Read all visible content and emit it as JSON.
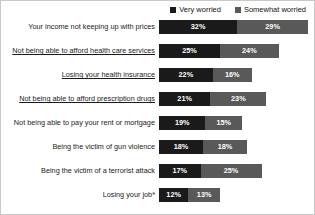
{
  "legend": {
    "position": "top-right",
    "items": [
      {
        "label": "Very worried",
        "color": "#1a1a1a",
        "key": "very"
      },
      {
        "label": "Somewhat worried",
        "color": "#595959",
        "key": "somewhat"
      }
    ]
  },
  "colors": {
    "very_worried": "#1a1a1a",
    "somewhat_worried": "#595959",
    "value_text": "#ffffff",
    "label_text": "#1a1a1a",
    "background": "#ffffff",
    "border": "#c9c9c9"
  },
  "chart_data": {
    "type": "bar",
    "orientation": "horizontal",
    "stacked": true,
    "title": "",
    "subtitle": "",
    "xlabel": "",
    "ylabel": "",
    "grid": false,
    "legend_position": "top-right",
    "xlim": [
      0,
      61
    ],
    "value_suffix": "%",
    "categories": [
      "Your income not keeping up with prices",
      "Not being able to afford health care services",
      "Losing your health insurance",
      "Not being able to afford prescription drugs",
      "Not being able to pay your rent or mortgage",
      "Being the victim of gun violence",
      "Being the victim of a terrorist attack",
      "Losing your job*"
    ],
    "series": [
      {
        "name": "Very worried",
        "color": "#1a1a1a",
        "values": [
          32,
          25,
          22,
          21,
          19,
          18,
          17,
          12
        ]
      },
      {
        "name": "Somewhat worried",
        "color": "#595959",
        "values": [
          29,
          24,
          16,
          23,
          15,
          18,
          25,
          13
        ]
      }
    ],
    "totals": [
      61,
      49,
      38,
      44,
      34,
      36,
      42,
      25
    ]
  },
  "rows": [
    {
      "label": "Your income not keeping up with prices",
      "underlined": false,
      "very": 32,
      "somewhat": 29,
      "very_text": "32%",
      "somewhat_text": "29%"
    },
    {
      "label": "Not being able to afford health care services",
      "underlined": true,
      "very": 25,
      "somewhat": 24,
      "very_text": "25%",
      "somewhat_text": "24%"
    },
    {
      "label": "Losing your health insurance",
      "underlined": true,
      "very": 22,
      "somewhat": 16,
      "very_text": "22%",
      "somewhat_text": "16%"
    },
    {
      "label": "Not being able to afford prescription drugs",
      "underlined": true,
      "very": 21,
      "somewhat": 23,
      "very_text": "21%",
      "somewhat_text": "23%"
    },
    {
      "label": "Not being able to pay your rent or mortgage",
      "underlined": false,
      "very": 19,
      "somewhat": 15,
      "very_text": "19%",
      "somewhat_text": "15%"
    },
    {
      "label": "Being the victim of gun violence",
      "underlined": false,
      "very": 18,
      "somewhat": 18,
      "very_text": "18%",
      "somewhat_text": "18%"
    },
    {
      "label": "Being the victim of a terrorist attack",
      "underlined": false,
      "very": 17,
      "somewhat": 25,
      "very_text": "17%",
      "somewhat_text": "25%"
    },
    {
      "label": "Losing your job*",
      "underlined": false,
      "very": 12,
      "somewhat": 13,
      "very_text": "12%",
      "somewhat_text": "13%"
    }
  ]
}
